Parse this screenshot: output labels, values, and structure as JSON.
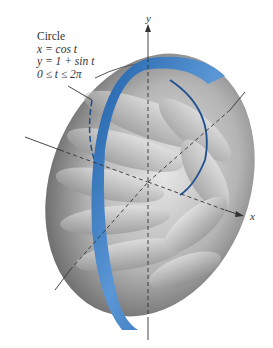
{
  "figure": {
    "type": "surface-of-revolution",
    "annotation": {
      "title": "Circle",
      "line1": "x = cos t",
      "line2": "y = 1 + sin t",
      "line3": "0 ≤ t ≤ 2π"
    },
    "axes": {
      "x_label": "x",
      "y_label": "y"
    },
    "colors": {
      "band": "#2f6fb8",
      "band_light": "#5a96d4",
      "surface_dark": "#6a6a6a",
      "surface_light": "#d9d9d9",
      "axis": "#333333"
    }
  }
}
